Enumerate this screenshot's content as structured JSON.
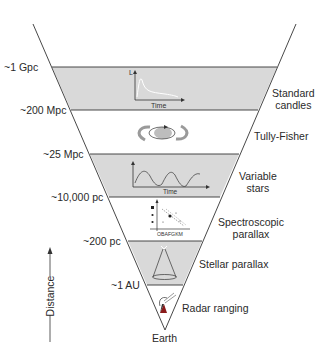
{
  "diagram": {
    "axis_label": "Distance",
    "apex_label": "Earth",
    "colors": {
      "shaded_band": "#d9d9d9",
      "line": "#333333",
      "background": "#ffffff"
    },
    "boundaries": [
      {
        "label": "~1 Gpc"
      },
      {
        "label": "~200 Mpc"
      },
      {
        "label": "~25 Mpc"
      },
      {
        "label": "~10,000 pc"
      },
      {
        "label": "~200 pc"
      },
      {
        "label": "~1 AU"
      }
    ],
    "methods": [
      {
        "line1": "Standard",
        "line2": "candles",
        "icon": "light-curve-icon",
        "icon_axis_y": "L",
        "icon_axis_x": "Time",
        "shaded": true
      },
      {
        "line1": "Tully-Fisher",
        "line2": "",
        "icon": "rotating-galaxy-icon",
        "shaded": false
      },
      {
        "line1": "Variable",
        "line2": "stars",
        "icon": "periodic-variable-icon",
        "icon_axis_x": "Time",
        "shaded": true
      },
      {
        "line1": "Spectroscopic",
        "line2": "parallax",
        "icon": "hr-diagram-icon",
        "icon_axis_x": "OBAFGKM",
        "shaded": false
      },
      {
        "line1": "Stellar parallax",
        "line2": "",
        "icon": "parallax-cone-icon",
        "shaded": true
      },
      {
        "line1": "Radar ranging",
        "line2": "",
        "icon": "radar-dish-icon",
        "shaded": false
      }
    ]
  }
}
